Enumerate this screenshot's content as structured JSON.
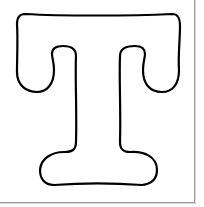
{
  "image": {
    "subject": "Outline letter T coloring page",
    "letter": "T",
    "stroke_color": "#000000",
    "fill_color": "#ffffff",
    "background_color": "#ffffff",
    "frame_color": "#9a9a9a"
  }
}
